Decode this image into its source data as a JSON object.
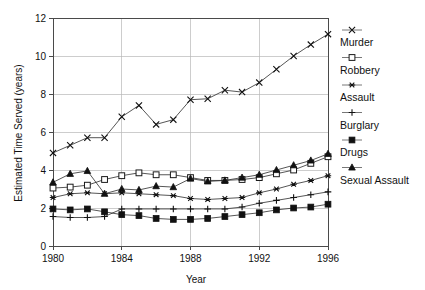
{
  "chart_data": {
    "type": "line",
    "title": "",
    "subtitle": "",
    "xlabel": "Year",
    "ylabel": "Estimated Time Served (years)",
    "xlim": [
      1980,
      1996
    ],
    "ylim": [
      0,
      12
    ],
    "xticks": [
      1980,
      1984,
      1988,
      1992,
      1996
    ],
    "yticks": [
      0,
      2,
      4,
      6,
      8,
      10,
      12
    ],
    "xtick_labels": [
      "1980",
      "1984",
      "1988",
      "1992",
      "1996"
    ],
    "ytick_labels": [
      "0",
      "2",
      "4",
      "6",
      "8",
      "10",
      "12"
    ],
    "grid": true,
    "legend_position": "right",
    "x": [
      1980,
      1981,
      1982,
      1983,
      1984,
      1985,
      1986,
      1987,
      1988,
      1989,
      1990,
      1991,
      1992,
      1993,
      1994,
      1995,
      1996
    ],
    "series": [
      {
        "name": "Murder",
        "marker": "x-cross",
        "values": [
          4.9,
          5.3,
          5.7,
          5.7,
          6.8,
          7.4,
          6.4,
          6.65,
          7.7,
          7.75,
          8.2,
          8.1,
          8.6,
          9.3,
          10.0,
          10.6,
          11.15
        ]
      },
      {
        "name": "Robbery",
        "marker": "open-square",
        "values": [
          3.05,
          3.1,
          3.2,
          3.5,
          3.7,
          3.85,
          3.75,
          3.75,
          3.6,
          3.45,
          3.45,
          3.5,
          3.6,
          3.8,
          4.0,
          4.35,
          4.7
        ]
      },
      {
        "name": "Assault",
        "marker": "asterisk",
        "values": [
          2.55,
          2.75,
          2.8,
          2.75,
          2.8,
          2.75,
          2.7,
          2.65,
          2.5,
          2.45,
          2.5,
          2.55,
          2.8,
          3.0,
          3.25,
          3.45,
          3.7
        ]
      },
      {
        "name": "Burglary",
        "marker": "plus",
        "values": [
          1.55,
          1.5,
          1.5,
          1.55,
          1.95,
          1.95,
          1.95,
          1.95,
          1.95,
          1.95,
          1.95,
          2.05,
          2.25,
          2.4,
          2.55,
          2.7,
          2.85
        ]
      },
      {
        "name": "Drugs",
        "marker": "filled-square",
        "values": [
          1.95,
          1.9,
          1.95,
          1.8,
          1.65,
          1.6,
          1.45,
          1.4,
          1.4,
          1.45,
          1.55,
          1.65,
          1.75,
          1.9,
          2.0,
          2.05,
          2.2
        ]
      },
      {
        "name": "Sexual Assault",
        "marker": "filled-triangle",
        "values": [
          3.35,
          3.8,
          3.95,
          2.75,
          3.0,
          2.95,
          3.15,
          3.1,
          3.55,
          3.4,
          3.45,
          3.6,
          3.75,
          4.0,
          4.25,
          4.5,
          4.85
        ]
      }
    ]
  },
  "legend": {
    "entries": [
      {
        "label": "Murder",
        "marker": "x-cross"
      },
      {
        "label": "Robbery",
        "marker": "open-square"
      },
      {
        "label": "Assault",
        "marker": "asterisk"
      },
      {
        "label": "Burglary",
        "marker": "plus"
      },
      {
        "label": "Drugs",
        "marker": "filled-square"
      },
      {
        "label": "Sexual Assault",
        "marker": "filled-triangle"
      }
    ]
  },
  "colors": {
    "background": "#ffffff",
    "axis": "#4a4a4a",
    "grid": "#b8b8b8",
    "ink": "#111111",
    "line": "#2b2b2b"
  }
}
